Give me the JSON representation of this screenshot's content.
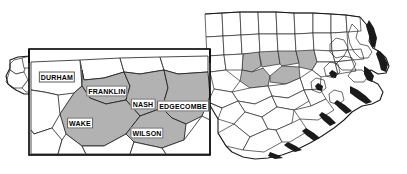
{
  "figure": {
    "name": "north-carolina-county-map-with-inset",
    "width": 407,
    "height": 174
  },
  "colors": {
    "highlight_fill": "#b2b2b2",
    "county_fill": "#ffffff",
    "outline": "#2a2a2a",
    "state_border": "#1a1a1a",
    "inset_border": "#000000",
    "label_text": "#000000",
    "label_background": "#ffffff"
  },
  "inset": {
    "name": "magnified-county-inset",
    "labels": [
      {
        "id": "durham",
        "text": "DURHAM",
        "x": 57,
        "y": 77,
        "shaded": false
      },
      {
        "id": "franklin",
        "text": "FRANKLIN",
        "x": 107,
        "y": 91,
        "shaded": true
      },
      {
        "id": "nash",
        "text": "NASH",
        "x": 143,
        "y": 104,
        "shaded": true
      },
      {
        "id": "edgecombe",
        "text": "EDGECOMBE",
        "x": 183,
        "y": 106,
        "shaded": true
      },
      {
        "id": "wake",
        "text": "WAKE",
        "x": 80,
        "y": 123,
        "shaded": true
      },
      {
        "id": "wilson",
        "text": "WILSON",
        "x": 147,
        "y": 133,
        "shaded": true
      }
    ]
  },
  "state_map": {
    "name": "north-carolina-state-outline",
    "highlighted_counties": [
      "DURHAM",
      "FRANKLIN",
      "NASH",
      "EDGECOMBE",
      "WAKE",
      "WILSON"
    ]
  }
}
